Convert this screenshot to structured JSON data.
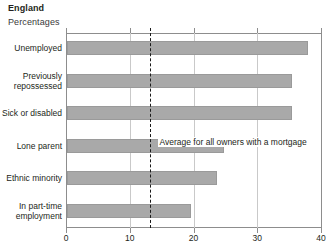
{
  "header": {
    "title": "England",
    "subtitle": "Percentages"
  },
  "chart_data": {
    "type": "bar",
    "orientation": "horizontal",
    "title": "England",
    "subtitle": "Percentages",
    "xlabel": "",
    "ylabel": "",
    "xlim": [
      0,
      40
    ],
    "xticks": [
      0,
      10,
      20,
      30,
      40
    ],
    "xtick_labels": [
      "0",
      "10",
      "20",
      "30",
      "40"
    ],
    "grid": true,
    "grid_axis": "x",
    "legend": false,
    "bar_color": "#a9a9a9",
    "bar_edge_color": "#9a9a9a",
    "categories": [
      "Unemployed",
      "Previously\nrepossessed",
      "Sick or disabled",
      "Lone parent",
      "Ethnic minority",
      "In part-time\nemployment"
    ],
    "values": [
      37.8,
      35.3,
      35.3,
      24.7,
      23.6,
      19.4
    ],
    "annotations": [
      {
        "type": "reference-line",
        "label": "Average for all owners with a mortgage",
        "value": 13.1,
        "style": "dashed",
        "color": "#1a1a1a"
      }
    ]
  }
}
